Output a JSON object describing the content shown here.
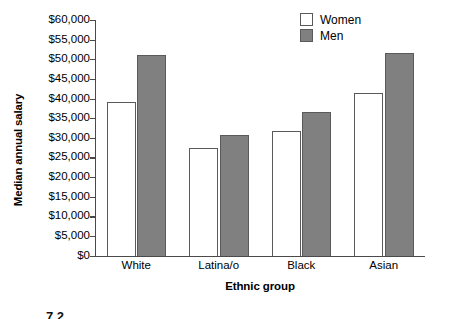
{
  "chart_data": {
    "type": "bar",
    "title": "",
    "xlabel": "Ethnic group",
    "ylabel": "Median annual salary",
    "categories": [
      "White",
      "Latina/o",
      "Black",
      "Asian"
    ],
    "series": [
      {
        "name": "Women",
        "values": [
          39000,
          27300,
          31700,
          41500
        ],
        "color": "#ffffff"
      },
      {
        "name": "Men",
        "values": [
          51000,
          30800,
          36700,
          51600
        ],
        "color": "#808080"
      }
    ],
    "ylim": [
      0,
      60000
    ],
    "yticks": [
      0,
      5000,
      10000,
      15000,
      20000,
      25000,
      30000,
      35000,
      40000,
      45000,
      50000,
      55000,
      60000
    ],
    "ytick_labels": [
      "$0",
      "$5,000",
      "$10,000",
      "$15,000",
      "$20,000",
      "$25,000",
      "$30,000",
      "$35,000",
      "$40,000",
      "$45,000",
      "$50,000",
      "$55,000",
      "$60,000"
    ],
    "grid": false,
    "legend_position": "top-right"
  },
  "legend": {
    "items": [
      {
        "label": "Women",
        "swatch": "women"
      },
      {
        "label": "Men",
        "swatch": "men"
      }
    ]
  },
  "caption": {
    "text": "7.2"
  }
}
